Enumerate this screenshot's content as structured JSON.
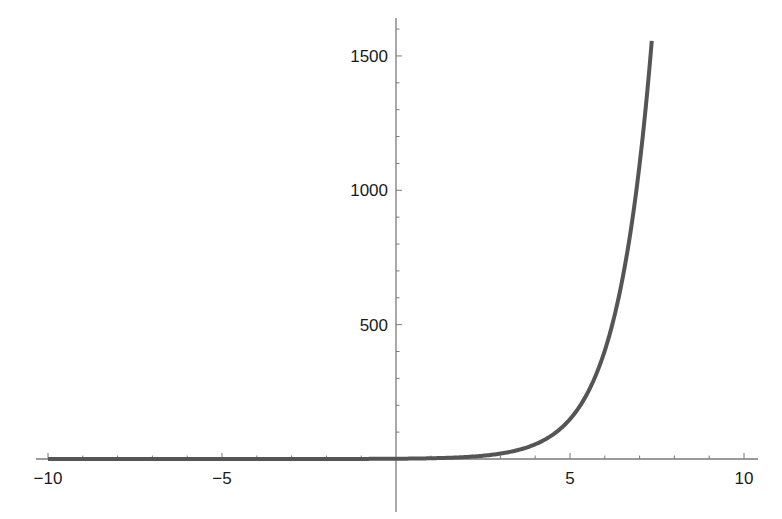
{
  "chart_data": {
    "type": "line",
    "title": "",
    "xlabel": "",
    "ylabel": "",
    "function": "exp(x)",
    "xlim": [
      -10,
      10
    ],
    "ylim": [
      0,
      1600
    ],
    "grid": false,
    "legend": null,
    "x_ticks": [
      -10,
      -5,
      5,
      10
    ],
    "x_tick_labels": [
      "−10",
      "−5",
      "5",
      "10"
    ],
    "y_ticks": [
      500,
      1000,
      1500
    ],
    "y_tick_labels": [
      "500",
      "1000",
      "1500"
    ],
    "series": [
      {
        "name": "exp(x)",
        "color": "#555555",
        "x": [
          -10,
          -8,
          -6,
          -4,
          -2,
          0,
          1,
          2,
          3,
          4,
          4.5,
          5,
          5.5,
          6,
          6.5,
          7,
          7.35
        ],
        "y": [
          0.0,
          0.0,
          0.0,
          0.02,
          0.14,
          1,
          2.7,
          7.4,
          20.1,
          54.6,
          90.0,
          148.4,
          244.7,
          403.4,
          665.1,
          1096.6,
          1556.2
        ]
      }
    ]
  }
}
